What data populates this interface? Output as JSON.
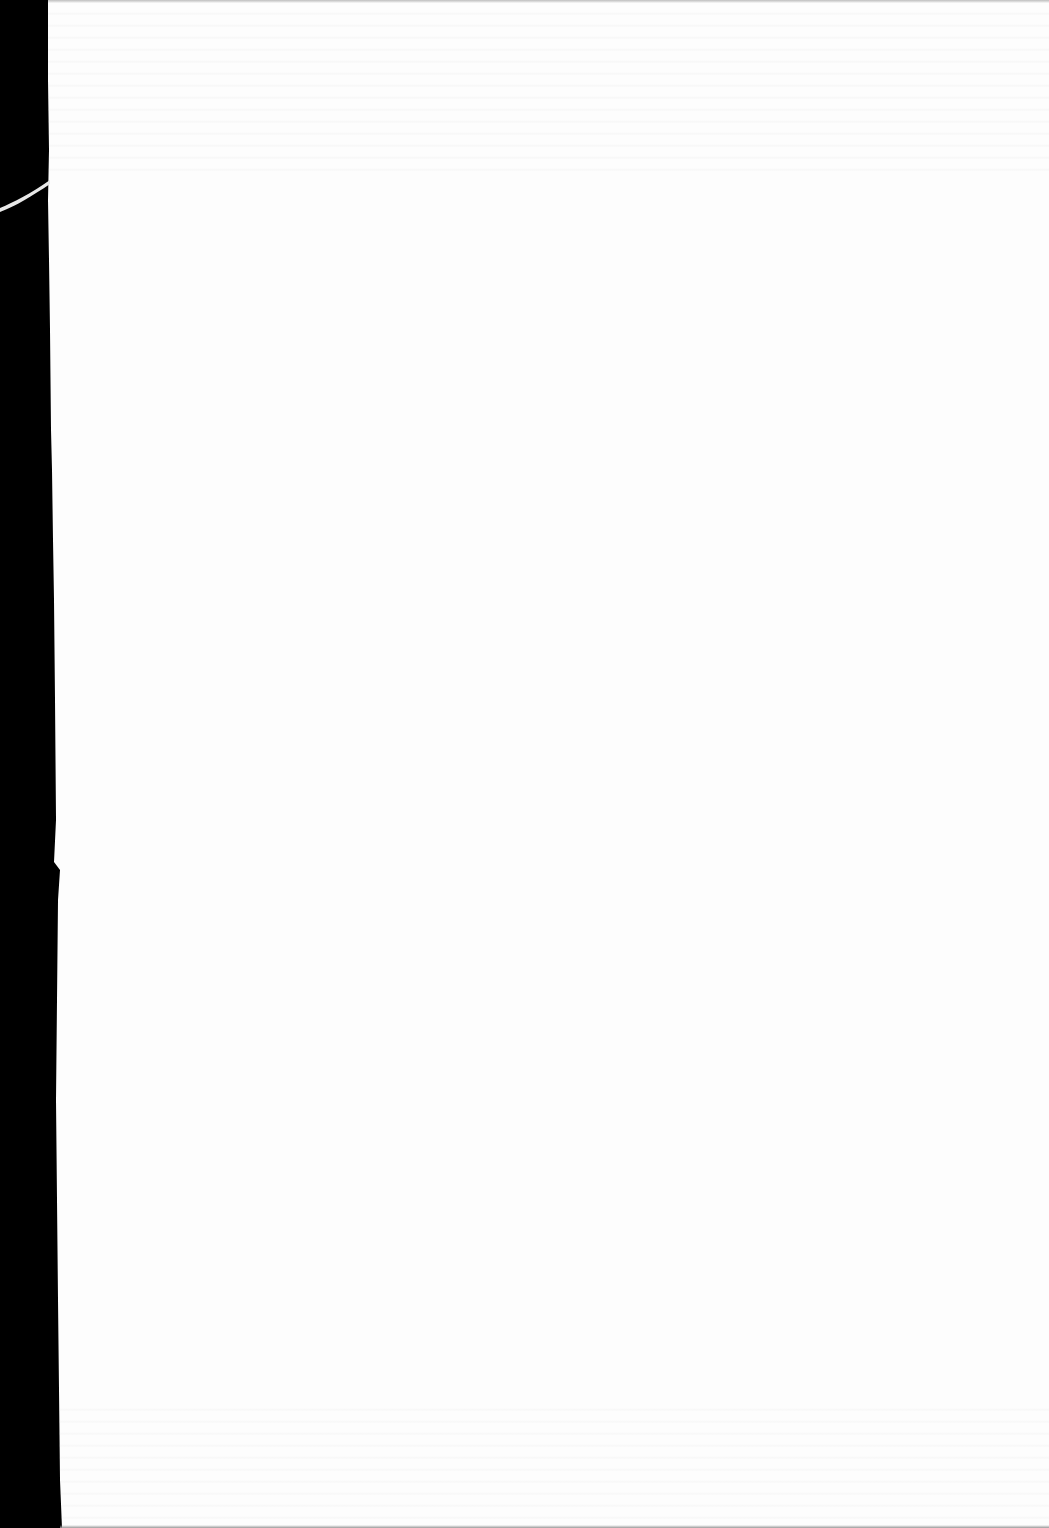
{
  "document": {
    "type": "scanned-page",
    "page_color": "#fdfdfd",
    "background_color": "#000000",
    "content_text": "",
    "blank": true
  }
}
